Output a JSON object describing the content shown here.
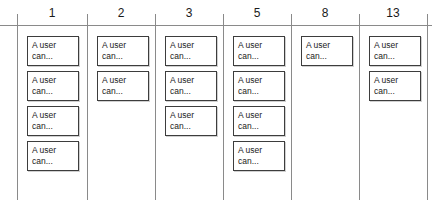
{
  "board": {
    "title": "Estimation Board",
    "card_text_line1": "A user",
    "card_text_line2": "can...",
    "line_color": "#8a8a8a",
    "card_border_color": "#3d3d3d",
    "text_color": "#1a1a1a",
    "background_color": "#ffffff",
    "columns": [
      {
        "header": "1",
        "card_count": 4
      },
      {
        "header": "2",
        "card_count": 2
      },
      {
        "header": "3",
        "card_count": 3
      },
      {
        "header": "5",
        "card_count": 4
      },
      {
        "header": "8",
        "card_count": 1
      },
      {
        "header": "13",
        "card_count": 2
      }
    ],
    "divider_positions": [
      17,
      87,
      155,
      223,
      291,
      359,
      427
    ]
  },
  "chart_data": {
    "type": "bar",
    "xlabel": "Story points",
    "ylabel": "Number of stories",
    "categories": [
      "1",
      "2",
      "3",
      "5",
      "8",
      "13"
    ],
    "values": [
      4,
      2,
      3,
      4,
      1,
      2
    ],
    "ylim": [
      0,
      4
    ],
    "grid": false,
    "legend": "none",
    "annotations": [
      "A user can..."
    ]
  }
}
